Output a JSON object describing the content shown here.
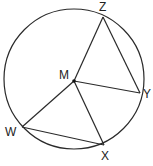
{
  "diagram": {
    "colors": {
      "stroke": "#2a2a2a",
      "label": "#222222",
      "background": "#ffffff"
    },
    "circle": {
      "center_label": "M",
      "cx": 74,
      "cy": 79,
      "r": 70
    },
    "points": [
      {
        "id": "Z",
        "label": "Z",
        "x": 103,
        "y": 17,
        "lx": 99,
        "ly": 11
      },
      {
        "id": "M",
        "label": "M",
        "x": 74,
        "y": 81,
        "lx": 59,
        "ly": 79
      },
      {
        "id": "Y",
        "label": "Y",
        "x": 140,
        "y": 93,
        "lx": 143,
        "ly": 98
      },
      {
        "id": "W",
        "label": "W",
        "x": 22,
        "y": 127,
        "lx": 5,
        "ly": 136
      },
      {
        "id": "X",
        "label": "X",
        "x": 104,
        "y": 145,
        "lx": 101,
        "ly": 160
      }
    ],
    "segments": [
      {
        "from": "M",
        "to": "Z"
      },
      {
        "from": "Z",
        "to": "Y"
      },
      {
        "from": "M",
        "to": "Y"
      },
      {
        "from": "M",
        "to": "W"
      },
      {
        "from": "M",
        "to": "X"
      },
      {
        "from": "W",
        "to": "X"
      }
    ]
  }
}
